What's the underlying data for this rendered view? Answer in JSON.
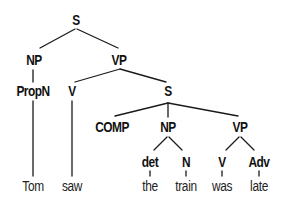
{
  "diagram": {
    "type": "syntax-tree",
    "sentence": "Tom saw the train was late",
    "nodes": {
      "s_root": {
        "label": "S",
        "kind": "category",
        "x": 76,
        "y": 20
      },
      "np_subj": {
        "label": "NP",
        "kind": "category",
        "x": 34,
        "y": 60
      },
      "vp_main": {
        "label": "VP",
        "kind": "category",
        "x": 119,
        "y": 60
      },
      "propn": {
        "label": "PropN",
        "kind": "category",
        "x": 33,
        "y": 91
      },
      "v_main": {
        "label": "V",
        "kind": "category",
        "x": 72,
        "y": 91
      },
      "s_emb": {
        "label": "S",
        "kind": "category",
        "x": 168,
        "y": 91
      },
      "comp": {
        "label": "COMP",
        "kind": "category",
        "x": 112,
        "y": 127
      },
      "np_emb": {
        "label": "NP",
        "kind": "category",
        "x": 168,
        "y": 127
      },
      "vp_emb": {
        "label": "VP",
        "kind": "category",
        "x": 240,
        "y": 127
      },
      "det": {
        "label": "det",
        "kind": "category",
        "x": 150,
        "y": 162
      },
      "n": {
        "label": "N",
        "kind": "category",
        "x": 186,
        "y": 162
      },
      "v_emb": {
        "label": "V",
        "kind": "category",
        "x": 222,
        "y": 162
      },
      "adv": {
        "label": "Adv",
        "kind": "category",
        "x": 259,
        "y": 162
      },
      "w_tom": {
        "label": "Tom",
        "kind": "word",
        "x": 33,
        "y": 186
      },
      "w_saw": {
        "label": "saw",
        "kind": "word",
        "x": 72,
        "y": 186
      },
      "w_the": {
        "label": "the",
        "kind": "word",
        "x": 150,
        "y": 186
      },
      "w_train": {
        "label": "train",
        "kind": "word",
        "x": 186,
        "y": 186
      },
      "w_was": {
        "label": "was",
        "kind": "word",
        "x": 222,
        "y": 186
      },
      "w_late": {
        "label": "late",
        "kind": "word",
        "x": 259,
        "y": 186
      }
    },
    "edges": [
      {
        "from": "s_root",
        "to": "np_subj",
        "x1": 75,
        "y1": 29,
        "x2": 40,
        "y2": 48
      },
      {
        "from": "s_root",
        "to": "vp_main",
        "x1": 77,
        "y1": 29,
        "x2": 118,
        "y2": 48
      },
      {
        "from": "np_subj",
        "to": "propn",
        "x1": 33,
        "y1": 70,
        "x2": 33,
        "y2": 82
      },
      {
        "from": "vp_main",
        "to": "v_main",
        "x1": 120,
        "y1": 69,
        "x2": 75,
        "y2": 82
      },
      {
        "from": "vp_main",
        "to": "s_emb",
        "x1": 120,
        "y1": 69,
        "x2": 166,
        "y2": 82
      },
      {
        "from": "propn",
        "to": "w_tom",
        "x1": 33,
        "y1": 101,
        "x2": 33,
        "y2": 176
      },
      {
        "from": "v_main",
        "to": "w_saw",
        "x1": 72,
        "y1": 101,
        "x2": 72,
        "y2": 176
      },
      {
        "from": "s_emb",
        "to": "comp",
        "x1": 168,
        "y1": 103,
        "x2": 115,
        "y2": 116
      },
      {
        "from": "s_emb",
        "to": "np_emb",
        "x1": 168,
        "y1": 103,
        "x2": 168,
        "y2": 117
      },
      {
        "from": "s_emb",
        "to": "vp_emb",
        "x1": 168,
        "y1": 103,
        "x2": 238,
        "y2": 116
      },
      {
        "from": "np_emb",
        "to": "det",
        "x1": 167,
        "y1": 137,
        "x2": 154,
        "y2": 150
      },
      {
        "from": "np_emb",
        "to": "n",
        "x1": 169,
        "y1": 137,
        "x2": 182,
        "y2": 150
      },
      {
        "from": "vp_emb",
        "to": "v_emb",
        "x1": 239,
        "y1": 137,
        "x2": 226,
        "y2": 150
      },
      {
        "from": "vp_emb",
        "to": "adv",
        "x1": 241,
        "y1": 137,
        "x2": 254,
        "y2": 150
      },
      {
        "from": "det",
        "to": "w_the",
        "x1": 150,
        "y1": 171,
        "x2": 150,
        "y2": 176
      },
      {
        "from": "n",
        "to": "w_train",
        "x1": 186,
        "y1": 171,
        "x2": 186,
        "y2": 176
      },
      {
        "from": "v_emb",
        "to": "w_was",
        "x1": 222,
        "y1": 171,
        "x2": 222,
        "y2": 176
      },
      {
        "from": "adv",
        "to": "w_late",
        "x1": 259,
        "y1": 171,
        "x2": 259,
        "y2": 176
      }
    ],
    "colors": {
      "line": "#1a1a1a",
      "text": "#111111",
      "background": "#ffffff"
    }
  }
}
